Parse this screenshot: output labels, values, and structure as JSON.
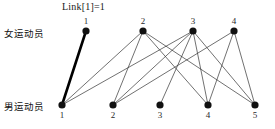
{
  "diagram": {
    "type": "bipartite-matching-graph",
    "annotation": "Link[1]=1",
    "row_labels": {
      "top": "女运动员",
      "bottom": "男运动员"
    },
    "colors": {
      "node": "#111111",
      "edge": "#333333",
      "matched_edge": "#000000",
      "background": "#ffffff",
      "text": "#1a1a1a"
    },
    "top_nodes": [
      {
        "id": "t1",
        "label": "1",
        "x": 86,
        "y": 31
      },
      {
        "id": "t2",
        "label": "2",
        "x": 143,
        "y": 31
      },
      {
        "id": "t3",
        "label": "3",
        "x": 193,
        "y": 31
      },
      {
        "id": "t4",
        "label": "4",
        "x": 234,
        "y": 31
      }
    ],
    "bottom_nodes": [
      {
        "id": "b1",
        "label": "1",
        "x": 62,
        "y": 105
      },
      {
        "id": "b2",
        "label": "2",
        "x": 113,
        "y": 105
      },
      {
        "id": "b3",
        "label": "3",
        "x": 160,
        "y": 105
      },
      {
        "id": "b4",
        "label": "4",
        "x": 208,
        "y": 105
      },
      {
        "id": "b5",
        "label": "5",
        "x": 255,
        "y": 105
      }
    ],
    "edges": [
      {
        "from": "t1",
        "to": "b1",
        "matched": true
      },
      {
        "from": "t2",
        "to": "b1",
        "matched": false
      },
      {
        "from": "t2",
        "to": "b2",
        "matched": false
      },
      {
        "from": "t2",
        "to": "b4",
        "matched": false
      },
      {
        "from": "t2",
        "to": "b5",
        "matched": false
      },
      {
        "from": "t3",
        "to": "b1",
        "matched": false
      },
      {
        "from": "t3",
        "to": "b2",
        "matched": false
      },
      {
        "from": "t3",
        "to": "b3",
        "matched": false
      },
      {
        "from": "t3",
        "to": "b4",
        "matched": false
      },
      {
        "from": "t3",
        "to": "b5",
        "matched": false
      },
      {
        "from": "t4",
        "to": "b2",
        "matched": false
      },
      {
        "from": "t4",
        "to": "b4",
        "matched": false
      },
      {
        "from": "t4",
        "to": "b5",
        "matched": false
      }
    ],
    "node_radius": 3.6,
    "matched_edge_width": 2.6,
    "edge_width": 0.7
  }
}
